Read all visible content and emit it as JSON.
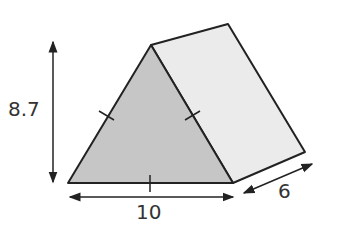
{
  "figure": {
    "type": "triangular-prism",
    "labels": {
      "height": "8.7",
      "base": "10",
      "depth": "6"
    },
    "colors": {
      "front_face": "#c8c8c8",
      "side_face": "#ebebeb",
      "stroke": "#222222"
    }
  }
}
